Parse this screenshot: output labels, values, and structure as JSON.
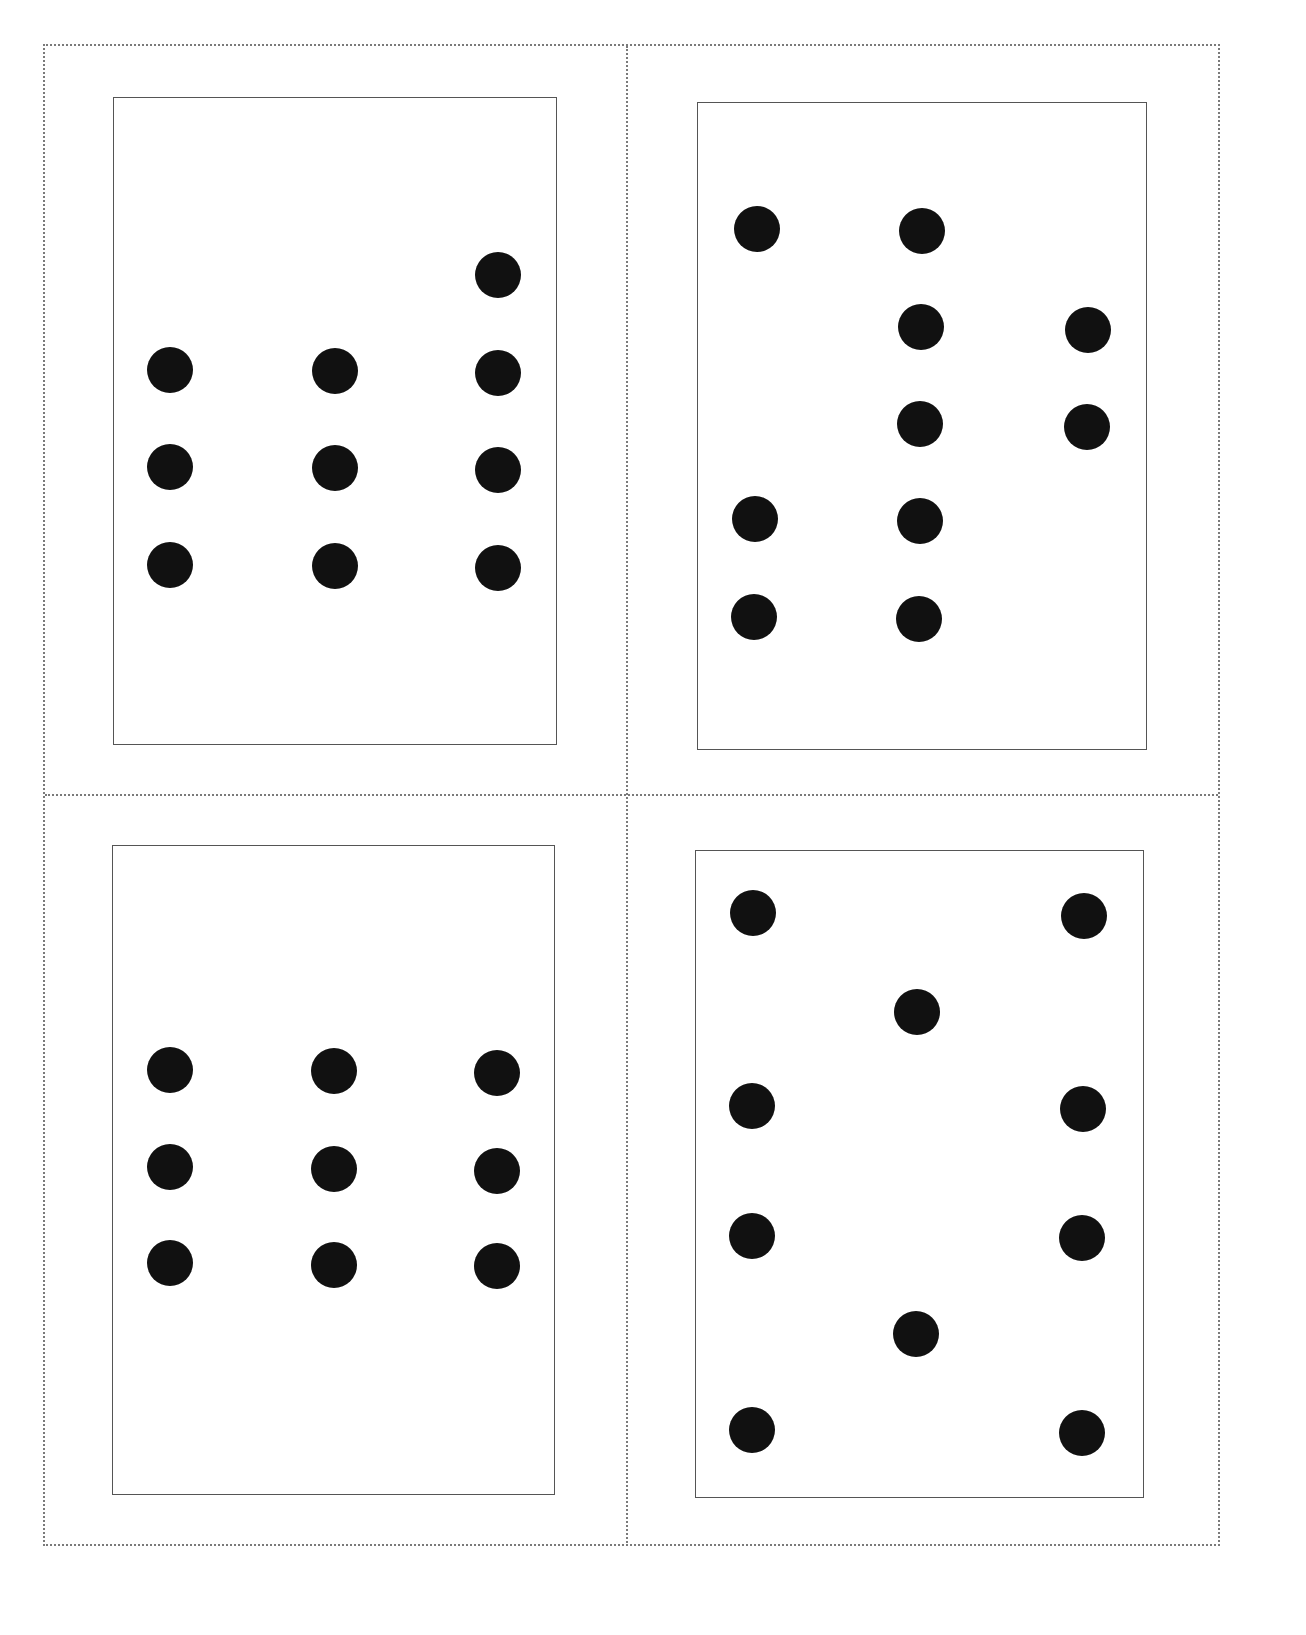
{
  "sheet": {
    "description": "Printable sheet of four dot cards with dotted cut lines",
    "border_style": "dotted",
    "cut_line_color": "#7a7a7a",
    "card_border_color": "#555555",
    "pip_color": "#111111",
    "pip_diameter": 46
  },
  "cards": [
    {
      "name": "card-top-left",
      "dot_count": 10,
      "rect": {
        "left": 113,
        "top": 97,
        "width": 444,
        "height": 648
      },
      "dots": [
        {
          "x": 498,
          "y": 275
        },
        {
          "x": 170,
          "y": 370
        },
        {
          "x": 335,
          "y": 371
        },
        {
          "x": 498,
          "y": 373
        },
        {
          "x": 170,
          "y": 467
        },
        {
          "x": 335,
          "y": 468
        },
        {
          "x": 498,
          "y": 470
        },
        {
          "x": 170,
          "y": 565
        },
        {
          "x": 335,
          "y": 566
        },
        {
          "x": 498,
          "y": 568
        }
      ]
    },
    {
      "name": "card-top-right",
      "dot_count": 10,
      "rect": {
        "left": 697,
        "top": 102,
        "width": 450,
        "height": 648
      },
      "dots": [
        {
          "x": 757,
          "y": 229
        },
        {
          "x": 922,
          "y": 231
        },
        {
          "x": 921,
          "y": 327
        },
        {
          "x": 1088,
          "y": 330
        },
        {
          "x": 920,
          "y": 424
        },
        {
          "x": 1087,
          "y": 427
        },
        {
          "x": 755,
          "y": 519
        },
        {
          "x": 920,
          "y": 521
        },
        {
          "x": 754,
          "y": 617
        },
        {
          "x": 919,
          "y": 619
        }
      ]
    },
    {
      "name": "card-bottom-left",
      "dot_count": 9,
      "rect": {
        "left": 112,
        "top": 845,
        "width": 443,
        "height": 650
      },
      "dots": [
        {
          "x": 170,
          "y": 1070
        },
        {
          "x": 334,
          "y": 1071
        },
        {
          "x": 497,
          "y": 1073
        },
        {
          "x": 170,
          "y": 1167
        },
        {
          "x": 334,
          "y": 1169
        },
        {
          "x": 497,
          "y": 1171
        },
        {
          "x": 170,
          "y": 1263
        },
        {
          "x": 334,
          "y": 1265
        },
        {
          "x": 497,
          "y": 1266
        }
      ]
    },
    {
      "name": "card-bottom-right",
      "dot_count": 10,
      "rect": {
        "left": 695,
        "top": 850,
        "width": 449,
        "height": 648
      },
      "dots": [
        {
          "x": 753,
          "y": 913
        },
        {
          "x": 1084,
          "y": 916
        },
        {
          "x": 917,
          "y": 1012
        },
        {
          "x": 752,
          "y": 1106
        },
        {
          "x": 1083,
          "y": 1109
        },
        {
          "x": 752,
          "y": 1236
        },
        {
          "x": 1082,
          "y": 1238
        },
        {
          "x": 916,
          "y": 1334
        },
        {
          "x": 752,
          "y": 1430
        },
        {
          "x": 1082,
          "y": 1433
        }
      ]
    }
  ]
}
